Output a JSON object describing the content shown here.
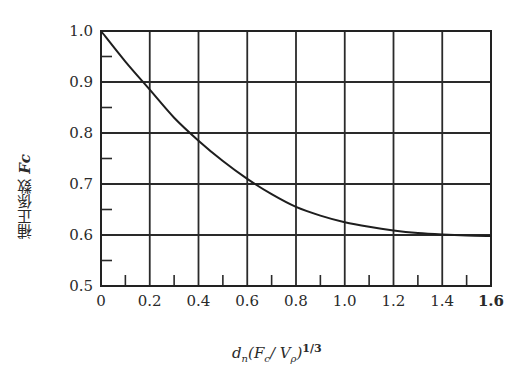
{
  "chart_data": {
    "type": "line",
    "title": "",
    "xlabel": "d_n(F_c/V_p)^(1/3)",
    "ylabel": "補正係数 Fc",
    "xlim": [
      0,
      1.6
    ],
    "ylim": [
      0.5,
      1.0
    ],
    "grid": true,
    "x_ticks": [
      "0",
      "0.2",
      "0.4",
      "0.6",
      "0.8",
      "1.0",
      "1.2",
      "1.4",
      "1.6"
    ],
    "y_ticks": [
      "0.5",
      "0.6",
      "0.7",
      "0.8",
      "0.9",
      "1.0"
    ],
    "series": [
      {
        "name": "Fc",
        "x": [
          0,
          0.1,
          0.2,
          0.3,
          0.4,
          0.5,
          0.6,
          0.7,
          0.8,
          0.9,
          1.0,
          1.1,
          1.2,
          1.3,
          1.4,
          1.5,
          1.6
        ],
        "values": [
          1.0,
          0.94,
          0.885,
          0.83,
          0.785,
          0.745,
          0.71,
          0.68,
          0.655,
          0.638,
          0.625,
          0.616,
          0.609,
          0.604,
          0.601,
          0.599,
          0.598
        ]
      }
    ],
    "legend": []
  },
  "axis": {
    "y_label_text": "補正係数 ",
    "y_label_symbol": "Fc",
    "x_label_main": "d",
    "x_label_sub": "n",
    "x_label_paren": "(F",
    "x_label_c": "c",
    "x_label_mid": "/ V",
    "x_label_p": "ρ",
    "x_label_close": ")",
    "x_label_exp": "1/3"
  }
}
